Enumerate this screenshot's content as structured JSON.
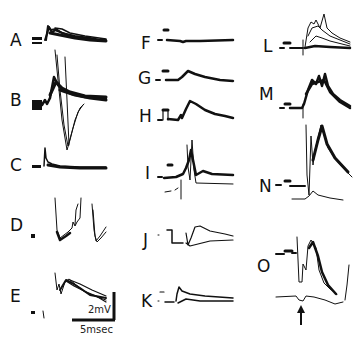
{
  "figure": {
    "panels": [
      {
        "id": "A",
        "label": "A",
        "x": 10,
        "y": 32
      },
      {
        "id": "B",
        "label": "B",
        "x": 10,
        "y": 92
      },
      {
        "id": "C",
        "label": "C",
        "x": 10,
        "y": 157
      },
      {
        "id": "D",
        "label": "D",
        "x": 10,
        "y": 217
      },
      {
        "id": "E",
        "label": "E",
        "x": 10,
        "y": 288
      },
      {
        "id": "F",
        "label": "F",
        "x": 141,
        "y": 35
      },
      {
        "id": "G",
        "label": "G",
        "x": 138,
        "y": 70
      },
      {
        "id": "H",
        "label": "H",
        "x": 139,
        "y": 108
      },
      {
        "id": "I",
        "label": "I",
        "x": 145,
        "y": 165
      },
      {
        "id": "J",
        "label": "J",
        "x": 143,
        "y": 232
      },
      {
        "id": "K",
        "label": "K",
        "x": 141,
        "y": 293
      },
      {
        "id": "L",
        "label": "L",
        "x": 263,
        "y": 38
      },
      {
        "id": "M",
        "label": "M",
        "x": 259,
        "y": 86
      },
      {
        "id": "N",
        "label": "N",
        "x": 259,
        "y": 178
      },
      {
        "id": "O",
        "label": "O",
        "x": 257,
        "y": 258
      }
    ],
    "scale_bar": {
      "voltage_label": "2mV",
      "time_label": "5msec",
      "voltage_mV": 2,
      "time_ms": 5
    },
    "stimulus_marker": {
      "icon": "up-arrow-icon",
      "x": 301,
      "y": 316
    },
    "colors": {
      "trace": "#111111",
      "background": "#ffffff"
    }
  }
}
